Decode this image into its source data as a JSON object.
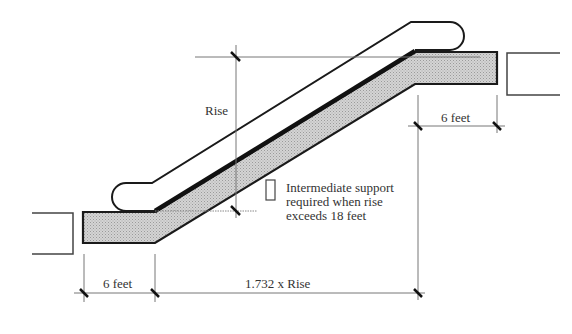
{
  "diagram": {
    "labels": {
      "rise": "Rise",
      "top_landing_length": "6 feet",
      "bottom_landing_length": "6 feet",
      "horizontal_run": "1.732 x Rise",
      "support_note_line1": "Intermediate support",
      "support_note_line2": "required when rise",
      "support_note_line3": "exceeds 18 feet"
    },
    "colors": {
      "truss_fill": "#cfcfcf",
      "outline": "#1a1a1a",
      "dimension_line": "#777777",
      "text": "#333333"
    }
  }
}
